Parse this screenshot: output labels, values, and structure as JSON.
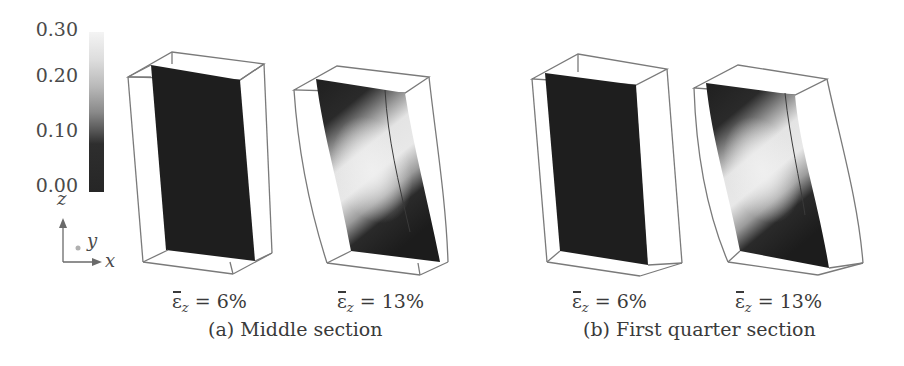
{
  "colorbar": {
    "ticks": [
      "0.30",
      "0.20",
      "0.10",
      "0.00"
    ],
    "min": 0.0,
    "max": 0.3,
    "colormap": "grayscale (dark = low, light = high)",
    "low_color": "#262626",
    "high_color": "#f4f4f4"
  },
  "axes_triad": {
    "z": "z",
    "y": "y",
    "x": "x"
  },
  "panels": [
    {
      "id": "a1",
      "strain_symbol": "ε",
      "strain_subscript": "z",
      "strain_value": " = 6%",
      "field": "uniform dark (near 0.00)"
    },
    {
      "id": "a2",
      "strain_symbol": "ε",
      "strain_subscript": "z",
      "strain_value": " = 13%",
      "field": "light diagonal shear band (~0.20-0.30) with dark corners"
    },
    {
      "id": "b1",
      "strain_symbol": "ε",
      "strain_subscript": "z",
      "strain_value": " = 6%",
      "field": "uniform dark (near 0.00)"
    },
    {
      "id": "b2",
      "strain_symbol": "ε",
      "strain_subscript": "z",
      "strain_value": " = 13%",
      "field": "light diagonal shear band (~0.20-0.30) with dark corners"
    }
  ],
  "captions": {
    "a": "(a) Middle section",
    "b": "(b) First quarter section"
  },
  "colors": {
    "edge": "#7a7a7a",
    "dark_field": "#1e1e1e",
    "light_field": "#e8e8e8",
    "text": "#3a3a3a"
  }
}
